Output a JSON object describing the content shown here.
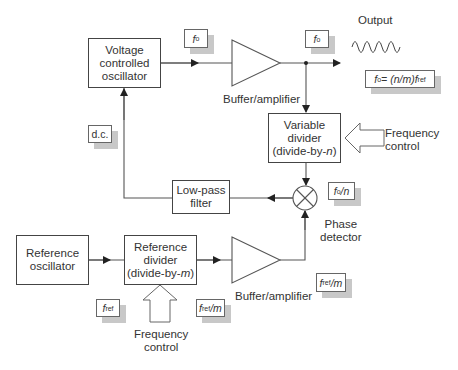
{
  "diagram": {
    "blocks": {
      "vco": [
        "Voltage",
        "controlled",
        "oscillator"
      ],
      "variable_divider": [
        "Variable",
        "divider",
        "(divide-by-n)"
      ],
      "low_pass_filter": [
        "Low-pass",
        "filter"
      ],
      "reference_oscillator": [
        "Reference",
        "oscillator"
      ],
      "reference_divider": [
        "Reference",
        "divider",
        "(divide-by-m)"
      ]
    },
    "labels": {
      "buffer_top": "Buffer/amplifier",
      "buffer_bottom": "Buffer/amplifier",
      "output": "Output",
      "phase_detector": [
        "Phase",
        "detector"
      ],
      "freq_control_right": [
        "Frequency",
        "control"
      ],
      "freq_control_bottom": [
        "Frequency",
        "control"
      ]
    },
    "signal_tags": {
      "f0_vco": {
        "main": "f",
        "sub": "o",
        "rest": ""
      },
      "f0_out": {
        "main": "f",
        "sub": "o",
        "rest": ""
      },
      "formula": {
        "main": "f",
        "sub": "o",
        "rest": " = (n/m)f",
        "sub2": "ref"
      },
      "dc": "d.c.",
      "f0_over_n": {
        "main": "f",
        "sub": "o",
        "rest": "/n"
      },
      "fref": {
        "main": "f",
        "sub": "ref",
        "rest": ""
      },
      "fref_over_m_1": {
        "main": "f",
        "sub": "ref",
        "rest": "/m"
      },
      "fref_over_m_2": {
        "main": "f",
        "sub": "ref",
        "rest": "/m"
      }
    },
    "colors": {
      "line": "#444444",
      "shadow": "#c8c8c8",
      "text": "#333333"
    }
  }
}
